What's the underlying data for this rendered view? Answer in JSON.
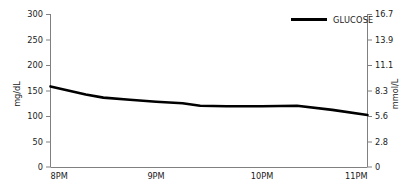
{
  "chart_data": {
    "type": "line",
    "title": "",
    "xlabel": "",
    "ylabel": "mg/dL",
    "y2label": "mmol/L",
    "grid": false,
    "legend_position": "top-right",
    "legend": [
      "GLUCOSE"
    ],
    "series": [
      {
        "name": "GLUCOSE",
        "color": "#000000",
        "x": [
          "8:00PM",
          "8:10PM",
          "8:20PM",
          "8:30PM",
          "8:45PM",
          "9:00PM",
          "9:15PM",
          "9:25PM",
          "9:40PM",
          "10:00PM",
          "10:20PM",
          "10:40PM",
          "11:00PM"
        ],
        "values": [
          158,
          150,
          142,
          136,
          132,
          128,
          125,
          120,
          119,
          119,
          120,
          112,
          102
        ]
      }
    ],
    "xticks": [
      "8PM",
      "9PM",
      "10PM",
      "11PM"
    ],
    "xtick_values": [
      0,
      1,
      2,
      3
    ],
    "xlim": [
      0,
      3
    ],
    "yticks": [
      "0",
      "50",
      "100",
      "150",
      "200",
      "250",
      "300"
    ],
    "ytick_values": [
      0,
      50,
      100,
      150,
      200,
      250,
      300
    ],
    "ylim": [
      0,
      300
    ],
    "y2ticks": [
      "0",
      "2.8",
      "5.6",
      "8.3",
      "11.1",
      "13.9",
      "16.7"
    ],
    "y2tick_values": [
      0,
      2.8,
      5.6,
      8.3,
      11.1,
      13.9,
      16.7
    ],
    "y2lim": [
      0,
      16.7
    ]
  },
  "axes": {
    "left": {
      "title": "mg/dL",
      "ticks": [
        {
          "label": "300",
          "value": 300
        },
        {
          "label": "250",
          "value": 250
        },
        {
          "label": "200",
          "value": 200
        },
        {
          "label": "150",
          "value": 150
        },
        {
          "label": "100",
          "value": 100
        },
        {
          "label": "50",
          "value": 50
        },
        {
          "label": "0",
          "value": 0
        }
      ]
    },
    "right": {
      "title": "mmol/L",
      "ticks": [
        {
          "label": "16.7",
          "value": 16.7
        },
        {
          "label": "13.9",
          "value": 13.9
        },
        {
          "label": "11.1",
          "value": 11.1
        },
        {
          "label": "8.3",
          "value": 8.3
        },
        {
          "label": "5.6",
          "value": 5.6
        },
        {
          "label": "2.8",
          "value": 2.8
        },
        {
          "label": "0",
          "value": 0
        }
      ]
    },
    "bottom": {
      "ticks": [
        {
          "label": "8PM",
          "value": 0
        },
        {
          "label": "9PM",
          "value": 1
        },
        {
          "label": "10PM",
          "value": 2
        },
        {
          "label": "11PM",
          "value": 3
        }
      ]
    }
  },
  "legend": {
    "items": [
      {
        "label": "GLUCOSE",
        "color": "#000000",
        "marker": "line-swatch"
      }
    ]
  },
  "colors": {
    "series_line": "#000000",
    "axis": "#808080",
    "text": "#1a1a1a",
    "background": "#ffffff"
  }
}
